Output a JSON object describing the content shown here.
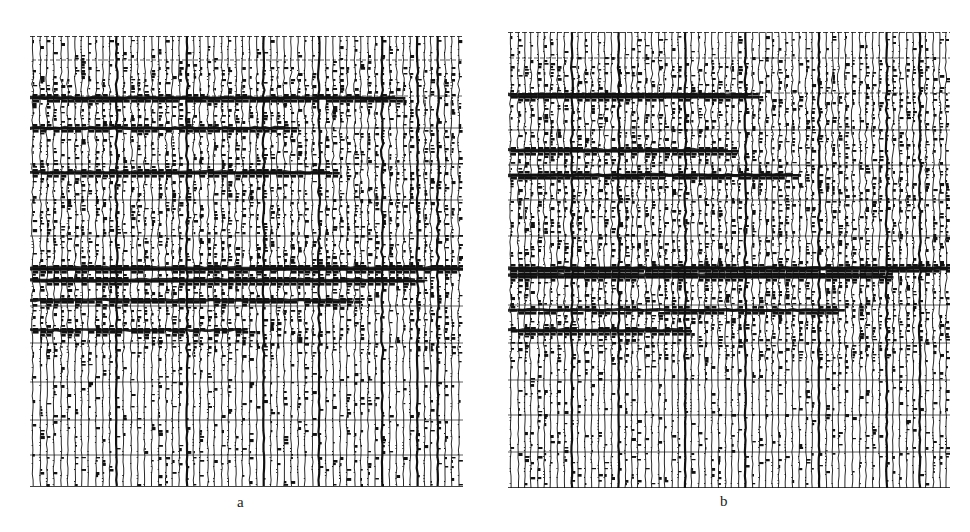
{
  "figure": {
    "background": "#ffffff",
    "ink": "#111111",
    "panels": [
      {
        "id": "a",
        "caption": "a",
        "box": {
          "x": 30,
          "y": 36,
          "w": 433,
          "h": 451
        },
        "caption_pos": {
          "x": 237,
          "y": 494
        },
        "trace_count": 62,
        "timing_lines_y": [
          24,
          60,
          92,
          128,
          164,
          200,
          234,
          270,
          307,
          346,
          384,
          419
        ],
        "top_lines_y": [
          0,
          24
        ],
        "strong_reflections": [
          {
            "y": 62,
            "x0": 0.0,
            "x1": 0.85,
            "weight": 1.0
          },
          {
            "y": 92,
            "x0": 0.0,
            "x1": 0.6,
            "weight": 0.8
          },
          {
            "y": 136,
            "x0": 0.0,
            "x1": 0.7,
            "weight": 0.7
          },
          {
            "y": 232,
            "x0": 0.0,
            "x1": 1.0,
            "weight": 1.0
          },
          {
            "y": 244,
            "x0": 0.0,
            "x1": 0.9,
            "weight": 0.9
          },
          {
            "y": 264,
            "x0": 0.0,
            "x1": 0.75,
            "weight": 0.7
          },
          {
            "y": 294,
            "x0": 0.0,
            "x1": 0.5,
            "weight": 0.6
          }
        ],
        "dense_zone": {
          "y0": 30,
          "y1": 320
        },
        "bold_traces": [
          12,
          22,
          33,
          41,
          50,
          55,
          58
        ],
        "seed": 17
      },
      {
        "id": "b",
        "caption": "b",
        "box": {
          "x": 508,
          "y": 32,
          "w": 442,
          "h": 456
        },
        "caption_pos": {
          "x": 720,
          "y": 493
        },
        "trace_count": 66,
        "timing_lines_y": [
          26,
          61,
          98,
          133,
          168,
          204,
          238,
          273,
          311,
          348,
          383,
          420
        ],
        "top_lines_y": [
          0,
          26
        ],
        "strong_reflections": [
          {
            "y": 63,
            "x0": 0.0,
            "x1": 0.55,
            "weight": 1.0
          },
          {
            "y": 118,
            "x0": 0.0,
            "x1": 0.5,
            "weight": 0.8
          },
          {
            "y": 143,
            "x0": 0.0,
            "x1": 0.65,
            "weight": 0.9
          },
          {
            "y": 236,
            "x0": 0.0,
            "x1": 1.0,
            "weight": 1.0
          },
          {
            "y": 243,
            "x0": 0.0,
            "x1": 0.85,
            "weight": 0.9
          },
          {
            "y": 278,
            "x0": 0.0,
            "x1": 0.75,
            "weight": 0.7
          },
          {
            "y": 298,
            "x0": 0.0,
            "x1": 0.4,
            "weight": 0.7
          }
        ],
        "dense_zone": {
          "y0": 30,
          "y1": 330
        },
        "bold_traces": [
          9,
          16,
          26,
          35,
          46,
          56,
          61
        ],
        "seed": 41
      }
    ]
  }
}
